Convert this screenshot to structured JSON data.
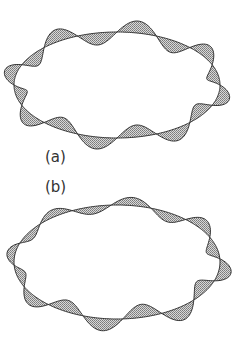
{
  "figure": {
    "panels": [
      {
        "label": "(a)",
        "base_shape": "ellipse",
        "center": [
          117,
          85
        ],
        "rx": 103,
        "ry": 53,
        "mode_number": 8,
        "amplitude": 12,
        "phase": 0.0
      },
      {
        "label": "(b)",
        "base_shape": "ellipse",
        "center": [
          117,
          262
        ],
        "rx": 103,
        "ry": 57,
        "mode_number": 8,
        "amplitude": 12,
        "phase": 0.45
      }
    ],
    "colors": {
      "line": "#333333",
      "fill": "#9a9a9a",
      "background": "#ffffff"
    }
  }
}
